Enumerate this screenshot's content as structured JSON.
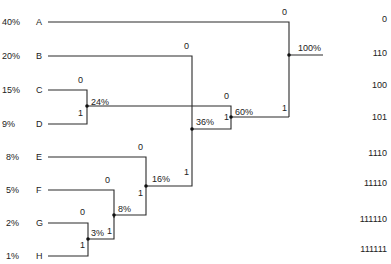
{
  "diagram": {
    "type": "huffman-tree",
    "symbols": [
      {
        "symbol": "A",
        "probability": "40%",
        "code": "0"
      },
      {
        "symbol": "B",
        "probability": "20%",
        "code": "110"
      },
      {
        "symbol": "C",
        "probability": "15%",
        "code": "100"
      },
      {
        "symbol": "D",
        "probability": "9%",
        "code": "101"
      },
      {
        "symbol": "E",
        "probability": "8%",
        "code": "1110"
      },
      {
        "symbol": "F",
        "probability": "5%",
        "code": "11110"
      },
      {
        "symbol": "G",
        "probability": "2%",
        "code": "111110"
      },
      {
        "symbol": "H",
        "probability": "1%",
        "code": "111111"
      }
    ],
    "nodes": [
      {
        "label": "3%",
        "zero": "0",
        "one": "1"
      },
      {
        "label": "8%",
        "zero": "0",
        "one": "1"
      },
      {
        "label": "16%",
        "zero": "0",
        "one": "1"
      },
      {
        "label": "24%",
        "zero": "0",
        "one": "1"
      },
      {
        "label": "36%",
        "zero": "0",
        "one": "1"
      },
      {
        "label": "60%",
        "zero": "0",
        "one": "1"
      },
      {
        "label": "100%",
        "zero": "0",
        "one": "1"
      }
    ],
    "line_color": "#2a2a2a"
  }
}
